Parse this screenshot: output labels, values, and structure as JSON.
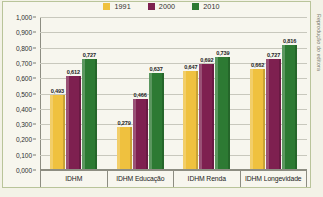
{
  "chart_data": {
    "type": "bar",
    "title": "",
    "xlabel": "",
    "ylabel": "",
    "ylim": [
      0,
      1.0
    ],
    "grid": true,
    "legend_position": "top-center",
    "categories": [
      "IDHM",
      "IDHM Educação",
      "IDHM Renda",
      "IDHM Longevidade"
    ],
    "ticklabels": [
      "0,000",
      "0,100",
      "0,200",
      "0,300",
      "0,400",
      "0,500",
      "0,600",
      "0,700",
      "0,800",
      "0,900",
      "1,000"
    ],
    "tickvalues": [
      0,
      0.1,
      0.2,
      0.3,
      0.4,
      0.5,
      0.6,
      0.7,
      0.8,
      0.9,
      1.0
    ],
    "series": [
      {
        "name": "1991",
        "color": "#EFC13F",
        "values": [
          0.493,
          0.279,
          0.647,
          0.662
        ],
        "labels": [
          "0,493",
          "0,279",
          "0,647",
          "0,662"
        ]
      },
      {
        "name": "2000",
        "color": "#7E2050",
        "values": [
          0.612,
          0.466,
          0.692,
          0.727
        ],
        "labels": [
          "0,612",
          "0,466",
          "0,692",
          "0,727"
        ]
      },
      {
        "name": "2010",
        "color": "#2D7A33",
        "values": [
          0.727,
          0.637,
          0.739,
          0.816
        ],
        "labels": [
          "0,727",
          "0,637",
          "0,739",
          "0,816"
        ]
      }
    ]
  },
  "credit": "Reprodução do editora",
  "caption": ""
}
